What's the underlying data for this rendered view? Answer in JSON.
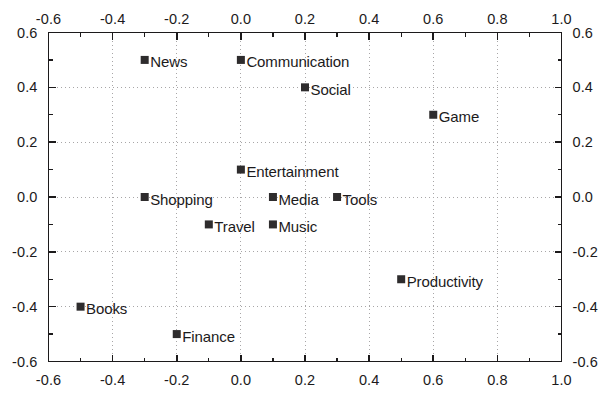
{
  "chart_data": {
    "type": "scatter",
    "title": "",
    "subtitle": "",
    "xlabel": "",
    "ylabel": "",
    "xlim": [
      -0.6,
      1.0
    ],
    "ylim": [
      -0.6,
      0.6
    ],
    "grid": true,
    "grid_style": "dotted",
    "grid_x_values": [
      -0.6,
      -0.4,
      -0.2,
      0.0,
      0.2,
      0.4,
      0.6,
      0.8,
      1.0
    ],
    "grid_y_values": [
      -0.6,
      -0.4,
      -0.2,
      0.0,
      0.2,
      0.4,
      0.6
    ],
    "legend": "none",
    "axes": {
      "top": {
        "ticks": [
          -0.6,
          -0.4,
          -0.2,
          0.0,
          0.2,
          0.4,
          0.6,
          0.8,
          1.0
        ],
        "tick_labels": [
          "-0.6",
          "-0.4",
          "-0.2",
          "0.0",
          "0.2",
          "0.4",
          "0.6",
          "0.8",
          "1.0"
        ],
        "minor_tick_step": 0.1,
        "labels_visible": true
      },
      "bottom": {
        "ticks": [
          -0.6,
          -0.4,
          -0.2,
          0.0,
          0.2,
          0.4,
          0.6,
          0.8,
          1.0
        ],
        "tick_labels": [
          "-0.6",
          "-0.4",
          "-0.2",
          "0.0",
          "0.2",
          "0.4",
          "0.6",
          "0.8",
          "1.0"
        ],
        "minor_tick_step": 0.1,
        "labels_visible": true
      },
      "left": {
        "ticks": [
          0.6,
          0.4,
          0.2,
          0.0,
          -0.2,
          -0.4,
          -0.6
        ],
        "tick_labels": [
          "0.6",
          "0.4",
          "0.2",
          "0.0",
          "-0.2",
          "-0.4",
          "-0.6"
        ],
        "minor_tick_step": 0.1,
        "labels_visible": true
      },
      "right": {
        "ticks": [
          0.6,
          0.4,
          0.2,
          0.0,
          -0.2,
          -0.4,
          -0.6
        ],
        "tick_labels": [
          "0.6",
          "0.4",
          "0.2",
          "0.0",
          "-0.2",
          "-0.4",
          "-0.6"
        ],
        "minor_tick_step": 0.1,
        "labels_visible": true
      }
    },
    "marker": {
      "shape": "square",
      "color": "#2e2c2d",
      "size_px": 8
    },
    "points": [
      {
        "label": "News",
        "x": -0.3,
        "y": 0.5,
        "label_pos": "right"
      },
      {
        "label": "Communication",
        "x": 0.0,
        "y": 0.5,
        "label_pos": "right"
      },
      {
        "label": "Social",
        "x": 0.2,
        "y": 0.4,
        "label_pos": "right"
      },
      {
        "label": "Game",
        "x": 0.6,
        "y": 0.3,
        "label_pos": "right"
      },
      {
        "label": "Entertainment",
        "x": 0.0,
        "y": 0.1,
        "label_pos": "right"
      },
      {
        "label": "Shopping",
        "x": -0.3,
        "y": 0.0,
        "label_pos": "right"
      },
      {
        "label": "Media",
        "x": 0.1,
        "y": 0.0,
        "label_pos": "right"
      },
      {
        "label": "Tools",
        "x": 0.3,
        "y": 0.0,
        "label_pos": "right"
      },
      {
        "label": "Travel",
        "x": -0.1,
        "y": -0.1,
        "label_pos": "right"
      },
      {
        "label": "Music",
        "x": 0.1,
        "y": -0.1,
        "label_pos": "right"
      },
      {
        "label": "Productivity",
        "x": 0.5,
        "y": -0.3,
        "label_pos": "right"
      },
      {
        "label": "Books",
        "x": -0.5,
        "y": -0.4,
        "label_pos": "right"
      },
      {
        "label": "Finance",
        "x": -0.2,
        "y": -0.5,
        "label_pos": "right"
      }
    ]
  },
  "colors": {
    "background": "#ffffff",
    "axis": "#1c1a1b",
    "grid": "#a8a6a7",
    "marker": "#2e2c2d",
    "text": "#1c1a1b"
  }
}
